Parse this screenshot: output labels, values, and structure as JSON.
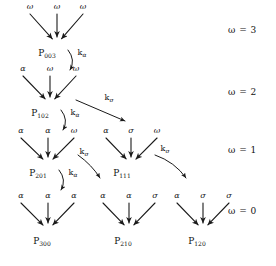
{
  "figure": {
    "type": "reaction-scheme-diagram",
    "symbols": {
      "alpha": "α",
      "sigma": "σ",
      "omega": "ω",
      "k": "k"
    }
  },
  "row_legends": [
    {
      "name": "omega-3",
      "text": "ω = 3",
      "x": 228,
      "y": 30
    },
    {
      "name": "omega-2",
      "text": "ω = 2",
      "x": 228,
      "y": 92
    },
    {
      "name": "omega-1",
      "text": "ω = 1",
      "x": 228,
      "y": 150
    },
    {
      "name": "omega-0",
      "text": "ω = 0",
      "x": 228,
      "y": 211
    }
  ],
  "nodes": [
    {
      "id": "p003",
      "label": "P",
      "subscript": "003",
      "apex_x": 57,
      "apex_y": 44,
      "label_x": 47,
      "label_y": 54,
      "arms": [
        {
          "symbol": "ω",
          "tip_x": 30,
          "tip_y": 14,
          "sym_x": 30,
          "sym_y": 7
        },
        {
          "symbol": "ω",
          "tip_x": 57,
          "tip_y": 14,
          "sym_x": 57,
          "sym_y": 7
        },
        {
          "symbol": "ω",
          "tip_x": 83,
          "tip_y": 14,
          "sym_x": 83,
          "sym_y": 7
        }
      ]
    },
    {
      "id": "p102",
      "label": "P",
      "subscript": "102",
      "apex_x": 50,
      "apex_y": 104,
      "label_x": 40,
      "label_y": 114,
      "arms": [
        {
          "symbol": "α",
          "tip_x": 23,
          "tip_y": 76,
          "sym_x": 23,
          "sym_y": 69
        },
        {
          "symbol": "ω",
          "tip_x": 50,
          "tip_y": 76,
          "sym_x": 50,
          "sym_y": 69
        },
        {
          "symbol": "ω",
          "tip_x": 76,
          "tip_y": 76,
          "sym_x": 76,
          "sym_y": 69
        }
      ]
    },
    {
      "id": "p201",
      "label": "P",
      "subscript": "201",
      "apex_x": 48,
      "apex_y": 164,
      "label_x": 38,
      "label_y": 174,
      "arms": [
        {
          "symbol": "α",
          "tip_x": 21,
          "tip_y": 138,
          "sym_x": 21,
          "sym_y": 131
        },
        {
          "symbol": "α",
          "tip_x": 48,
          "tip_y": 138,
          "sym_x": 48,
          "sym_y": 131
        },
        {
          "symbol": "ω",
          "tip_x": 74,
          "tip_y": 138,
          "sym_x": 74,
          "sym_y": 131
        }
      ]
    },
    {
      "id": "p111",
      "label": "P",
      "subscript": "111",
      "apex_x": 131,
      "apex_y": 164,
      "label_x": 122,
      "label_y": 174,
      "arms": [
        {
          "symbol": "α",
          "tip_x": 106,
          "tip_y": 138,
          "sym_x": 106,
          "sym_y": 131
        },
        {
          "symbol": "σ",
          "tip_x": 131,
          "tip_y": 138,
          "sym_x": 131,
          "sym_y": 131
        },
        {
          "symbol": "ω",
          "tip_x": 157,
          "tip_y": 138,
          "sym_x": 157,
          "sym_y": 131
        }
      ]
    },
    {
      "id": "p300",
      "label": "P",
      "subscript": "300",
      "apex_x": 48,
      "apex_y": 230,
      "label_x": 42,
      "label_y": 242,
      "arms": [
        {
          "symbol": "α",
          "tip_x": 21,
          "tip_y": 203,
          "sym_x": 21,
          "sym_y": 196
        },
        {
          "symbol": "α",
          "tip_x": 48,
          "tip_y": 203,
          "sym_x": 48,
          "sym_y": 196
        },
        {
          "symbol": "α",
          "tip_x": 74,
          "tip_y": 203,
          "sym_x": 74,
          "sym_y": 196
        }
      ]
    },
    {
      "id": "p210",
      "label": "P",
      "subscript": "210",
      "apex_x": 129,
      "apex_y": 230,
      "label_x": 123,
      "label_y": 242,
      "arms": [
        {
          "symbol": "α",
          "tip_x": 103,
          "tip_y": 203,
          "sym_x": 103,
          "sym_y": 196
        },
        {
          "symbol": "α",
          "tip_x": 129,
          "tip_y": 203,
          "sym_x": 129,
          "sym_y": 196
        },
        {
          "symbol": "σ",
          "tip_x": 155,
          "tip_y": 203,
          "sym_x": 155,
          "sym_y": 196
        }
      ]
    },
    {
      "id": "p120",
      "label": "P",
      "subscript": "120",
      "apex_x": 203,
      "apex_y": 230,
      "label_x": 197,
      "label_y": 242,
      "arms": [
        {
          "symbol": "α",
          "tip_x": 177,
          "tip_y": 203,
          "sym_x": 177,
          "sym_y": 196
        },
        {
          "symbol": "σ",
          "tip_x": 203,
          "tip_y": 203,
          "sym_x": 203,
          "sym_y": 196
        },
        {
          "symbol": "σ",
          "tip_x": 229,
          "tip_y": 203,
          "sym_x": 229,
          "sym_y": 196
        }
      ]
    }
  ],
  "transitions": [
    {
      "id": "t-p003-p102",
      "from": "p003",
      "to": "p102",
      "rate": "k",
      "rate_sub": "α",
      "kind": "curve",
      "path": "M 68 50 Q 76 60 70 70",
      "label_x": 82,
      "label_y": 53
    },
    {
      "id": "t-p102-p201",
      "from": "p102",
      "to": "p201",
      "rate": "k",
      "rate_sub": "α",
      "kind": "curve",
      "path": "M 61 110 Q 69 120 63 130",
      "label_x": 75,
      "label_y": 113
    },
    {
      "id": "t-p102-p111",
      "from": "p102",
      "to": "p111",
      "rate": "k",
      "rate_sub": "σ",
      "kind": "line",
      "path": "M 76 100 L 125 121",
      "label_x": 109,
      "label_y": 98
    },
    {
      "id": "t-p201-p300",
      "from": "p201",
      "to": "p300",
      "rate": "k",
      "rate_sub": "α",
      "kind": "curve",
      "path": "M 59 170 Q 67 180 61 190",
      "label_x": 73,
      "label_y": 173
    },
    {
      "id": "t-p201-p210",
      "from": "p201",
      "to": "p210",
      "rate": "k",
      "rate_sub": "σ",
      "kind": "curve",
      "path": "M 78 155 Q 92 165 100 178",
      "label_x": 84,
      "label_y": 152
    },
    {
      "id": "t-p111-p120",
      "from": "p111",
      "to": "p120",
      "rate": "k",
      "rate_sub": "σ",
      "kind": "curve",
      "path": "M 155 155 Q 175 162 186 178",
      "label_x": 165,
      "label_y": 149
    }
  ]
}
